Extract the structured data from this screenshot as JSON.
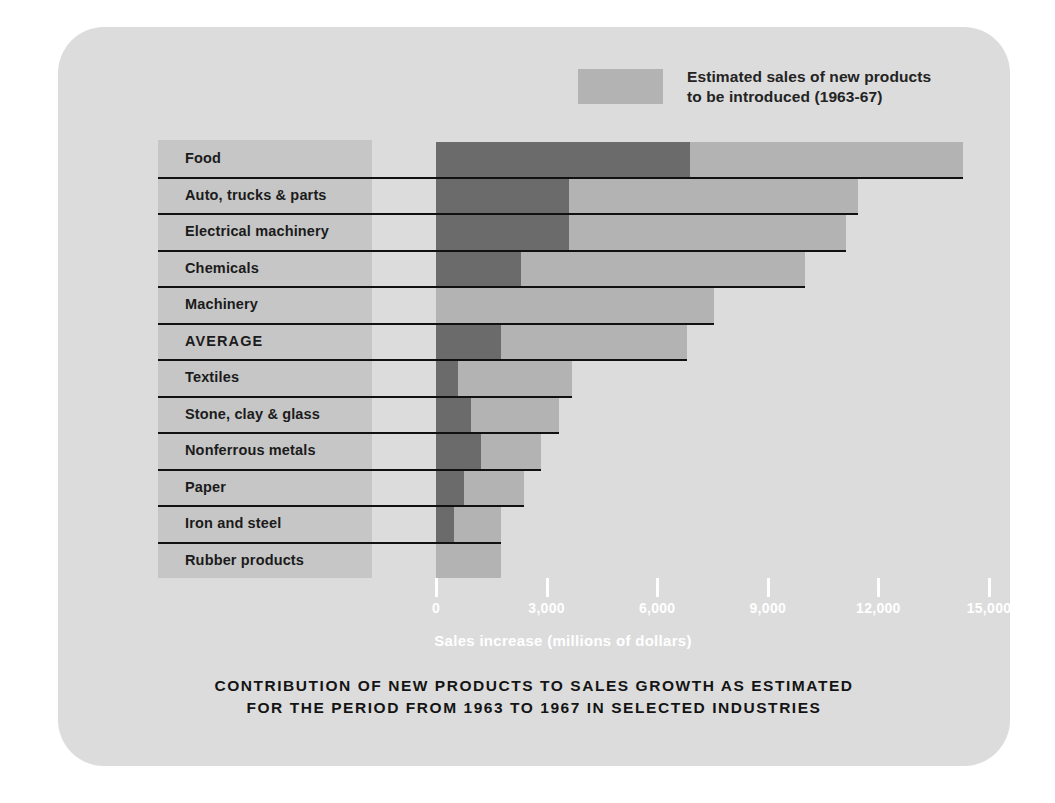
{
  "card": {
    "background_color": "#dcdcdc"
  },
  "legend": {
    "swatch_color": "#b3b3b3",
    "text": "Estimated sales of new products\nto be introduced (1963-67)"
  },
  "chart_data": {
    "type": "bar",
    "orientation": "horizontal",
    "stacked": true,
    "title": "CONTRIBUTION OF NEW PRODUCTS TO SALES GROWTH AS ESTIMATED\nFOR THE PERIOD FROM 1963 TO 1967 IN SELECTED INDUSTRIES",
    "xlabel": "Sales increase (millions of dollars)",
    "ylabel": "",
    "xlim": [
      0,
      15600
    ],
    "xticks": [
      0,
      3000,
      6000,
      9000,
      12000,
      15000
    ],
    "xticklabels": [
      "0",
      "3,000",
      "6,000",
      "9,000",
      "12,000",
      "15,000"
    ],
    "grid": false,
    "legend_position": "top-right",
    "categories": [
      "Food",
      "Auto, trucks & parts",
      "Electrical machinery",
      "Chemicals",
      "Machinery",
      "AVERAGE",
      "Textiles",
      "Stone, clay & glass",
      "Nonferrous metals",
      "Paper",
      "Iron and steel",
      "Rubber products"
    ],
    "series": [
      {
        "name": "Sales increase from existing products",
        "color": "#6b6b6b",
        "values": [
          6900,
          3600,
          3600,
          2300,
          0,
          1760,
          600,
          950,
          1220,
          760,
          490,
          0
        ]
      },
      {
        "name": "Estimated sales of new products to be introduced (1963-67)",
        "color": "#b3b3b3",
        "values": [
          7400,
          7850,
          7520,
          7700,
          7550,
          5040,
          3100,
          2390,
          1630,
          1630,
          1270,
          1760
        ]
      }
    ],
    "totals": [
      14300,
      11450,
      11120,
      10000,
      7550,
      6800,
      3700,
      3340,
      2850,
      2390,
      1760,
      1760
    ],
    "emphasized_category": "AVERAGE"
  }
}
